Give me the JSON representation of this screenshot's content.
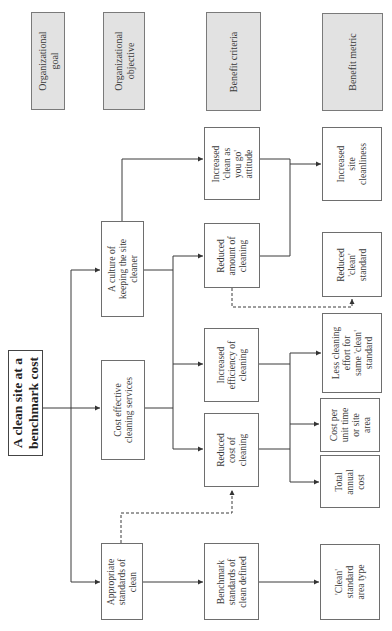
{
  "headers": {
    "organizational_goal": "Organizational\ngoal",
    "organizational_objective": "Organizational\nobjective",
    "benefit_criteria": "Benefit criteria",
    "benefit_metric": "Benefit metric"
  },
  "goal": {
    "label": "A clean site at a\nbenchmark cost"
  },
  "objectives": [
    {
      "id": "culture",
      "label": "A culture of\nkeeping the site\ncleaner"
    },
    {
      "id": "cost_effective",
      "label": "Cost effective\ncleaning services"
    },
    {
      "id": "appropriate",
      "label": "Appropriate\nstandards of\nclean"
    }
  ],
  "criteria": [
    {
      "id": "clean_as_you_go",
      "label": "Increased\n'clean as\nyou go'\nattitude"
    },
    {
      "id": "reduced_amount",
      "label": "Reduced\namount of\ncleaning"
    },
    {
      "id": "increased_efficiency",
      "label": "Increased\nefficiency of\ncleaning"
    },
    {
      "id": "reduced_cost",
      "label": "Reduced\ncost of\ncleaning"
    },
    {
      "id": "benchmark",
      "label": "Benchmark\nstandards of\nclean defined"
    }
  ],
  "metrics": [
    {
      "id": "site_cleanliness",
      "label": "Increased\nsite\ncleanliness"
    },
    {
      "id": "reduced_clean_standard",
      "label": "Reduced\n'clean'\nstandard"
    },
    {
      "id": "less_cleaning_effort",
      "label": "Less cleaning\neffort for\nsame 'clean'\nstandard"
    },
    {
      "id": "cost_per_unit",
      "label": "Cost per\nunit time\nor site\narea"
    },
    {
      "id": "total_annual_cost",
      "label": "Total\nannual\ncost"
    },
    {
      "id": "clean_standard_area",
      "label": "'Clean'\nstandard\narea type"
    }
  ],
  "colors": {
    "header_fill": "#e2e2e2",
    "line": "#3a3a3a",
    "border": "#6e6e6e"
  }
}
